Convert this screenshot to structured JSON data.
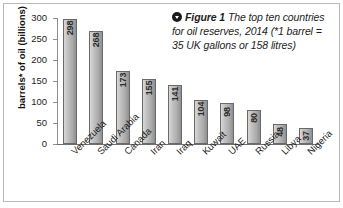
{
  "figure": {
    "bullet_icon": "chevron-down-circle-icon",
    "label": "Figure 1",
    "caption": "The top ten countries for oil reserves, 2014 (*1 barrel = 35 UK gallons or 158 litres)"
  },
  "chart_data": {
    "type": "bar",
    "title": "",
    "xlabel": "",
    "ylabel": "barrels* of oil (billions)",
    "categories": [
      "Venezuela",
      "Saudi Arabia",
      "Canada",
      "Iran",
      "Iraq",
      "Kuwait",
      "UAE",
      "Russia",
      "Libya",
      "Nigeria"
    ],
    "values": [
      298,
      268,
      173,
      155,
      141,
      104,
      98,
      80,
      48,
      37
    ],
    "value_labels": [
      "298",
      "268",
      "173",
      "155",
      "141",
      "104",
      "98",
      "80",
      "48",
      "37"
    ],
    "ylim": [
      0,
      300
    ],
    "yticks": [
      300,
      250,
      200,
      150,
      100,
      50,
      0
    ],
    "ytick_labels": [
      "300",
      "250",
      "200",
      "150",
      "100",
      "50",
      "0"
    ],
    "grid": false,
    "legend": false,
    "bar_color": "#b4b4b4",
    "bar_edge_color": "#6a6a6a"
  }
}
